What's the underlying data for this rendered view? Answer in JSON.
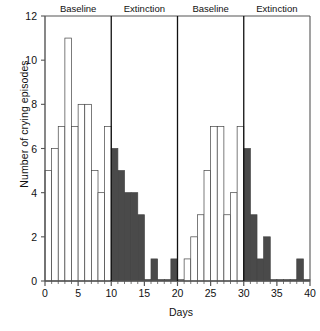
{
  "chart_data": {
    "type": "bar",
    "title": "",
    "xlabel": "Days",
    "ylabel": "Number of crying episodes",
    "xlim": [
      0,
      40
    ],
    "ylim": [
      0,
      12
    ],
    "xticks": [
      0,
      5,
      10,
      15,
      20,
      25,
      30,
      35,
      40
    ],
    "yticks": [
      0,
      2,
      4,
      6,
      8,
      10,
      12
    ],
    "grid": false,
    "legend": "none",
    "x": [
      1,
      2,
      3,
      4,
      5,
      6,
      7,
      8,
      9,
      10,
      11,
      12,
      13,
      14,
      15,
      16,
      17,
      18,
      19,
      20,
      21,
      22,
      23,
      24,
      25,
      26,
      27,
      28,
      29,
      30,
      31,
      32,
      33,
      34,
      35,
      36,
      37,
      38,
      39,
      40
    ],
    "values": [
      5,
      6,
      7,
      11,
      7,
      8,
      8,
      5,
      4,
      7,
      6,
      5,
      4,
      4,
      3,
      0,
      1,
      0,
      0,
      1,
      0,
      1,
      2,
      3,
      5,
      7,
      7,
      3,
      4,
      7,
      6,
      3,
      1,
      2,
      0,
      0,
      0,
      0,
      1,
      0
    ],
    "phases": [
      {
        "name": "Baseline",
        "start_day": 0,
        "end_day": 10,
        "fill": "#ffffff",
        "label_day": 5
      },
      {
        "name": "Extinction",
        "start_day": 10,
        "end_day": 20,
        "fill": "#4a4a4a",
        "label_day": 15
      },
      {
        "name": "Baseline",
        "start_day": 20,
        "end_day": 30,
        "fill": "#ffffff",
        "label_day": 25
      },
      {
        "name": "Extinction",
        "start_day": 30,
        "end_day": 40,
        "fill": "#4a4a4a",
        "label_day": 35
      }
    ],
    "phase_dividers": [
      10,
      20,
      30
    ],
    "colors": {
      "baseline_bar": "#ffffff",
      "extinction_bar": "#4a4a4a",
      "bar_edge": "#444444",
      "axis": "#555555",
      "text": "#111111"
    }
  }
}
